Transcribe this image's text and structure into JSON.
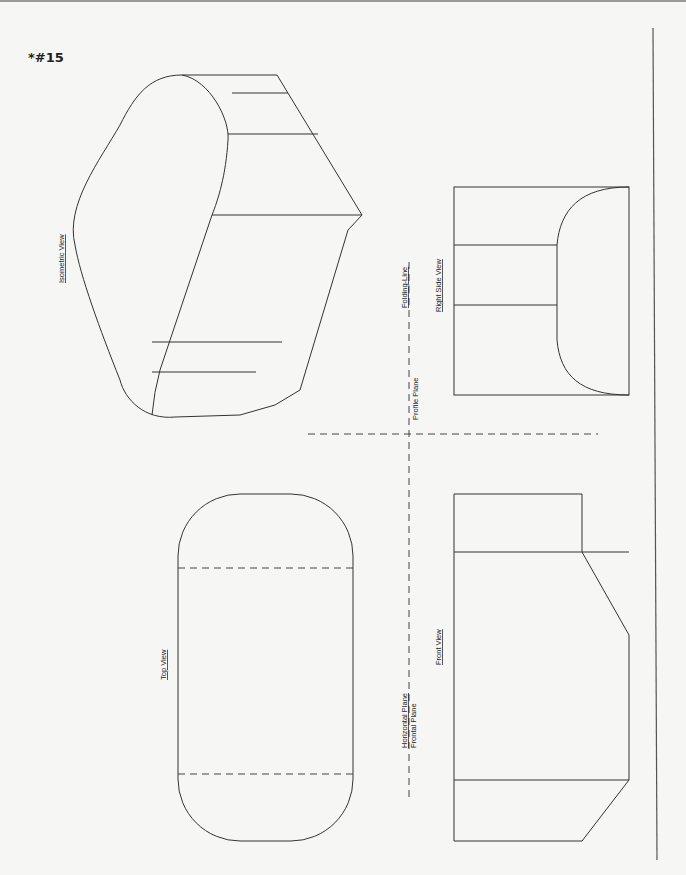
{
  "problem_number": "*#15",
  "labels": {
    "isometric_view": "Isometric View",
    "top_view": "Top View",
    "front_view": "Front View",
    "right_side_view": "Right Side View",
    "folding_line": "Folding-Line",
    "profile_plane": "Profile Plane",
    "horizontal_plane": "Horizontal Plane",
    "frontal_plane": "Frontal Plane"
  }
}
